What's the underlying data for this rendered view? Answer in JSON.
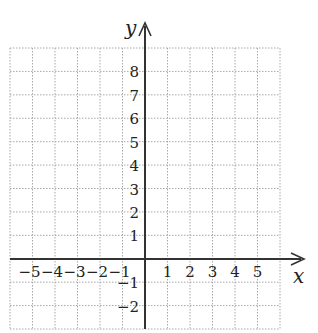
{
  "figure": {
    "type": "coordinate-grid",
    "x_axis_label": "x",
    "y_axis_label": "y",
    "x_range": [
      -6,
      6
    ],
    "y_range": [
      -3,
      9
    ],
    "x_tick_labels": [
      {
        "value": -5,
        "text": "−5"
      },
      {
        "value": -4,
        "text": "−4"
      },
      {
        "value": -3,
        "text": "−3"
      },
      {
        "value": -2,
        "text": "−2"
      },
      {
        "value": -1,
        "text": "−1"
      },
      {
        "value": 1,
        "text": "1"
      },
      {
        "value": 2,
        "text": "2"
      },
      {
        "value": 3,
        "text": "3"
      },
      {
        "value": 4,
        "text": "4"
      },
      {
        "value": 5,
        "text": "5"
      }
    ],
    "y_tick_labels": [
      {
        "value": 8,
        "text": "8"
      },
      {
        "value": 7,
        "text": "7"
      },
      {
        "value": 6,
        "text": "6"
      },
      {
        "value": 5,
        "text": "5"
      },
      {
        "value": 4,
        "text": "4"
      },
      {
        "value": 3,
        "text": "3"
      },
      {
        "value": 2,
        "text": "2"
      },
      {
        "value": 1,
        "text": "1"
      },
      {
        "value": -1,
        "text": "−1"
      },
      {
        "value": -2,
        "text": "−2"
      }
    ],
    "grid": {
      "style": "dotted",
      "color": "#a8a8a8",
      "step": 1
    },
    "axis_color": "#333333",
    "text_color": "#222222"
  }
}
